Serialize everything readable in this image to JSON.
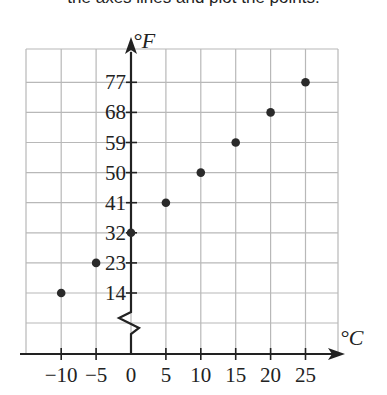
{
  "caption": "the axes lines and plot the points.",
  "chart_data": {
    "type": "scatter",
    "title": "",
    "xlabel": "°C",
    "ylabel": "°F",
    "x_ticks": [
      -10,
      -5,
      0,
      5,
      10,
      15,
      20,
      25
    ],
    "x_tick_labels": [
      "−10",
      "−5",
      "0",
      "5",
      "10",
      "15",
      "20",
      "25"
    ],
    "y_ticks": [
      14,
      23,
      32,
      41,
      50,
      59,
      68,
      77
    ],
    "y_tick_labels": [
      "14",
      "23",
      "32",
      "41",
      "50",
      "59",
      "68",
      "77"
    ],
    "y_axis_break": true,
    "grid": true,
    "series": [
      {
        "name": "Temperature conversion",
        "points": [
          {
            "x": -10,
            "y": 14
          },
          {
            "x": -5,
            "y": 23
          },
          {
            "x": 0,
            "y": 32
          },
          {
            "x": 5,
            "y": 41
          },
          {
            "x": 10,
            "y": 50
          },
          {
            "x": 15,
            "y": 59
          },
          {
            "x": 20,
            "y": 68
          },
          {
            "x": 25,
            "y": 77
          }
        ]
      }
    ],
    "colors": {
      "grid": "#b8b8b8",
      "axis": "#222222",
      "point": "#2a2a2a"
    }
  }
}
